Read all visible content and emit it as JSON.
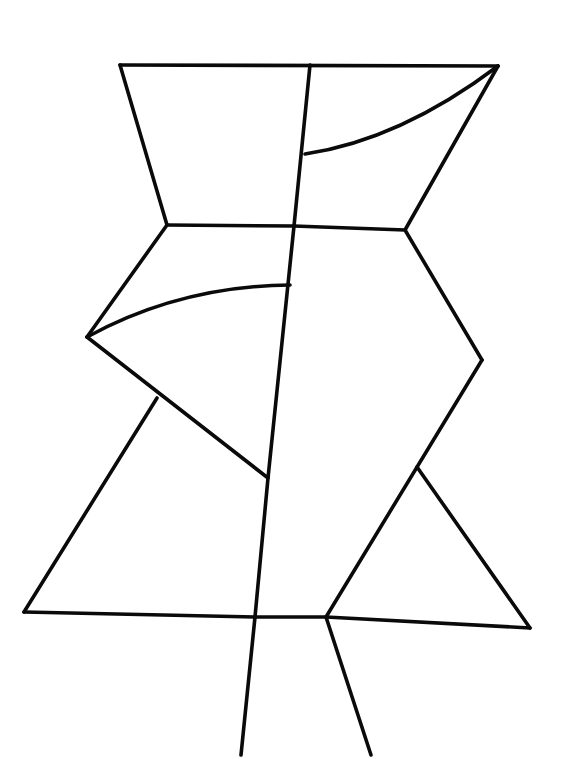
{
  "artwork": {
    "background": "#ffffff",
    "ink": "#0a0a0a",
    "stroke_width": 3.6,
    "lines": [
      {
        "name": "top-edge",
        "d": "M120 65 L498 66"
      },
      {
        "name": "top-left-side",
        "d": "M120 65 L167 225"
      },
      {
        "name": "top-right-side",
        "d": "M498 66 L405 230"
      },
      {
        "name": "upper-vertical",
        "d": "M310 65 L294 226"
      },
      {
        "name": "upper-arc",
        "d": "M305 154 Q400 140 498 66"
      },
      {
        "name": "waist-edge",
        "d": "M167 225 L294 226 L405 230"
      },
      {
        "name": "left-upper-diagonal",
        "d": "M167 225 L87 337"
      },
      {
        "name": "left-arc",
        "d": "M87 337 Q180 286 290 285"
      },
      {
        "name": "left-lower-diagonal",
        "d": "M87 337 L268 478"
      },
      {
        "name": "right-upper-diagonal",
        "d": "M405 230 L482 360"
      },
      {
        "name": "right-lower-diagonal",
        "d": "M482 360 L326 617"
      },
      {
        "name": "central-vertical",
        "d": "M294 226 L268 478 L255 617 L241 755"
      },
      {
        "name": "left-triangle-side",
        "d": "M157 398 L24 612"
      },
      {
        "name": "base-edge",
        "d": "M24 612 L255 617 L326 617 L530 628"
      },
      {
        "name": "right-triangle-side",
        "d": "M417 467 L530 628"
      },
      {
        "name": "right-leg",
        "d": "M326 617 L371 755"
      }
    ]
  }
}
